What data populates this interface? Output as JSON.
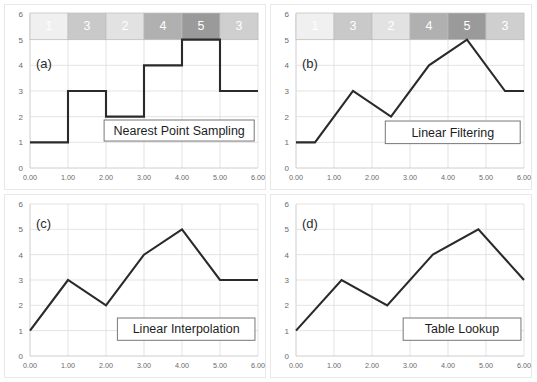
{
  "figure": {
    "background_color": "#ffffff",
    "line_color": "#2a2a2a",
    "grid_color": "#dcdcdc",
    "axis_color": "#c8c8c8"
  },
  "axes": {
    "x_ticks": [
      "0.00",
      "1.00",
      "2.00",
      "3.00",
      "4.00",
      "5.00",
      "6.00"
    ],
    "x_values": [
      0,
      1,
      2,
      3,
      4,
      5,
      6
    ],
    "y_ticks": [
      "0",
      "1",
      "2",
      "3",
      "4",
      "5",
      "6"
    ],
    "y_values": [
      0,
      1,
      2,
      3,
      4,
      5,
      6
    ],
    "xlim": [
      0,
      6
    ],
    "ylim": [
      0,
      6
    ],
    "grid": true
  },
  "texel_bar": {
    "labels": [
      "1",
      "3",
      "2",
      "4",
      "5",
      "3"
    ],
    "values": [
      1,
      3,
      2,
      4,
      5,
      3
    ],
    "colors": [
      "#f0f0f0",
      "#c9c9c9",
      "#e2e2e2",
      "#b0b0b0",
      "#9a9a9a",
      "#cfcfcf"
    ],
    "border_color": "#bdbdbd",
    "text_color": "#ffffff"
  },
  "panels": [
    {
      "tag": "(a)",
      "label": "Nearest Point Sampling",
      "has_texel_bar": true,
      "label_box": {
        "x": 1.95,
        "y": 1.05,
        "w": 3.95,
        "h": 0.82
      }
    },
    {
      "tag": "(b)",
      "label": "Linear Filtering",
      "has_texel_bar": true,
      "label_box": {
        "x": 2.35,
        "y": 0.95,
        "w": 3.55,
        "h": 0.88
      }
    },
    {
      "tag": "(c)",
      "label": "Linear Interpolation",
      "has_texel_bar": false,
      "label_box": {
        "x": 2.3,
        "y": 0.62,
        "w": 3.62,
        "h": 0.88
      }
    },
    {
      "tag": "(d)",
      "label": "Table Lookup",
      "has_texel_bar": false,
      "label_box": {
        "x": 2.82,
        "y": 0.62,
        "w": 3.1,
        "h": 0.88
      }
    }
  ],
  "chart_data": [
    {
      "type": "line",
      "title": "Nearest Point Sampling",
      "panel": "(a)",
      "xlabel": "",
      "ylabel": "",
      "xlim": [
        0,
        6
      ],
      "ylim": [
        0,
        6
      ],
      "grid": true,
      "legend": "none",
      "interpolation": "step",
      "categories": [
        "0.00",
        "1.00",
        "2.00",
        "3.00",
        "4.00",
        "5.00",
        "6.00"
      ],
      "series": [
        {
          "name": "nearest",
          "x": [
            0,
            1,
            1,
            2,
            2,
            3,
            3,
            4,
            4,
            5,
            5,
            6
          ],
          "values": [
            1,
            1,
            3,
            3,
            2,
            2,
            4,
            4,
            5,
            5,
            3,
            3
          ]
        }
      ],
      "sample_values": [
        1,
        3,
        2,
        4,
        5,
        3
      ]
    },
    {
      "type": "line",
      "title": "Linear Filtering",
      "panel": "(b)",
      "xlabel": "",
      "ylabel": "",
      "xlim": [
        0,
        6
      ],
      "ylim": [
        0,
        6
      ],
      "grid": true,
      "legend": "none",
      "interpolation": "linear",
      "series": [
        {
          "name": "linear-filter",
          "x": [
            0,
            0.5,
            1.5,
            2.5,
            3.5,
            4.5,
            5.5,
            6
          ],
          "values": [
            1,
            1,
            3,
            2,
            4,
            5,
            3,
            3
          ]
        }
      ],
      "sample_values": [
        1,
        3,
        2,
        4,
        5,
        3
      ]
    },
    {
      "type": "line",
      "title": "Linear Interpolation",
      "panel": "(c)",
      "xlabel": "",
      "ylabel": "",
      "xlim": [
        0,
        6
      ],
      "ylim": [
        0,
        6
      ],
      "grid": true,
      "legend": "none",
      "interpolation": "linear",
      "series": [
        {
          "name": "linear-interp",
          "x": [
            0,
            1,
            2,
            3,
            4,
            5,
            6
          ],
          "values": [
            1,
            3,
            2,
            4,
            5,
            3,
            3
          ]
        }
      ],
      "sample_values": [
        1,
        3,
        2,
        4,
        5,
        3,
        3
      ]
    },
    {
      "type": "line",
      "title": "Table Lookup",
      "panel": "(d)",
      "xlabel": "",
      "ylabel": "",
      "xlim": [
        0,
        6
      ],
      "ylim": [
        0,
        6
      ],
      "grid": true,
      "legend": "none",
      "interpolation": "linear",
      "series": [
        {
          "name": "table-lookup",
          "x": [
            0,
            1.2,
            2.4,
            3.6,
            4.8,
            6
          ],
          "values": [
            1,
            3,
            2,
            4,
            5,
            3
          ]
        }
      ],
      "sample_values": [
        1,
        3,
        2,
        4,
        5,
        3
      ]
    }
  ]
}
